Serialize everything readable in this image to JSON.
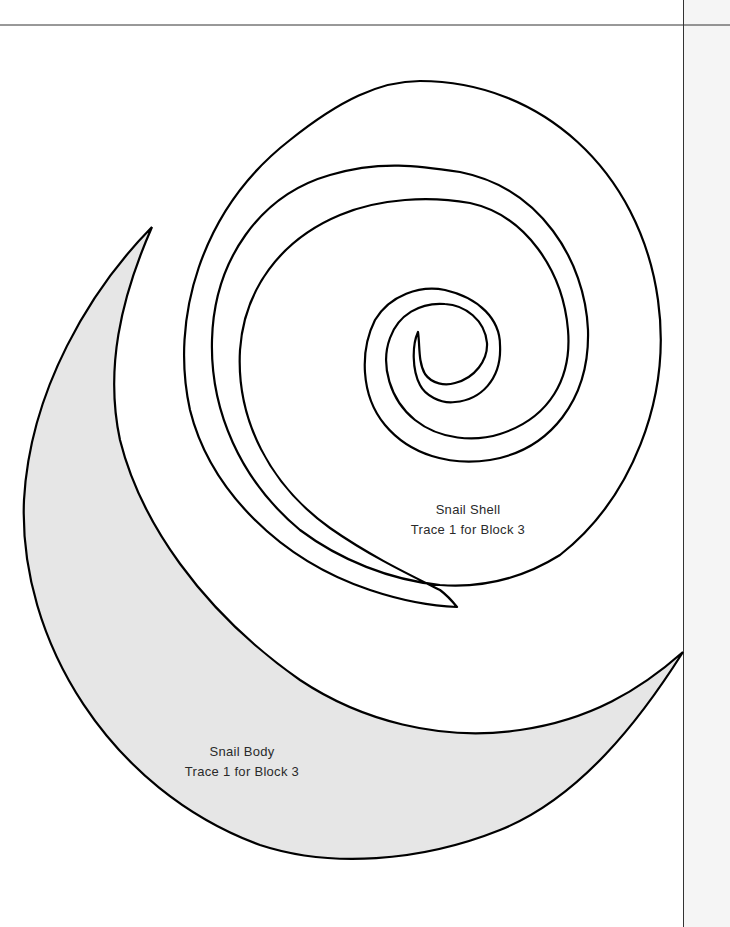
{
  "document": {
    "type": "quilt-applique-template",
    "colors": {
      "background": "#ffffff",
      "margin_strip": "#f5f5f5",
      "outline": "#000000",
      "body_fill": "#e6e6e6",
      "shell_fill": "#ffffff",
      "rule_line": "#333333"
    }
  },
  "pieces": {
    "shell": {
      "title": "Snail Shell",
      "instruction": "Trace 1 for Block 3"
    },
    "body": {
      "title": "Snail Body",
      "instruction": "Trace 1 for Block 3"
    }
  }
}
